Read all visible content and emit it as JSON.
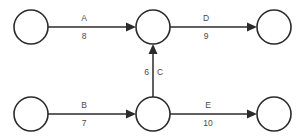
{
  "diagram": {
    "type": "directed-graph",
    "title": "",
    "background_color": "#ffffff",
    "stroke_color": "#2b2b2b",
    "label_color": "#4a4a4a",
    "nodes": [
      {
        "id": "n1",
        "label": "",
        "cx": 31,
        "cy": 27,
        "r": 17
      },
      {
        "id": "n2",
        "label": "",
        "cx": 153,
        "cy": 27,
        "r": 17
      },
      {
        "id": "n3",
        "label": "",
        "cx": 274,
        "cy": 27,
        "r": 17
      },
      {
        "id": "n4",
        "label": "",
        "cx": 31,
        "cy": 114,
        "r": 17
      },
      {
        "id": "n5",
        "label": "",
        "cx": 153,
        "cy": 114,
        "r": 17
      },
      {
        "id": "n6",
        "label": "",
        "cx": 274,
        "cy": 114,
        "r": 17
      }
    ],
    "edges": [
      {
        "id": "e_a",
        "name": "A",
        "weight": "8",
        "from": "n1",
        "to": "n2",
        "orientation": "horizontal",
        "label_x": 84,
        "name_y": 19,
        "weight_y": 37
      },
      {
        "id": "e_d",
        "name": "D",
        "weight": "9",
        "from": "n2",
        "to": "n3",
        "orientation": "horizontal",
        "label_x": 206,
        "name_y": 19,
        "weight_y": 37
      },
      {
        "id": "e_c",
        "name": "C",
        "weight": "6",
        "from": "n5",
        "to": "n2",
        "orientation": "vertical",
        "label_y": 73,
        "name_x": 157,
        "weight_x": 149
      },
      {
        "id": "e_b",
        "name": "B",
        "weight": "7",
        "from": "n4",
        "to": "n5",
        "orientation": "horizontal",
        "label_x": 84,
        "name_y": 106,
        "weight_y": 124
      },
      {
        "id": "e_e",
        "name": "E",
        "weight": "10",
        "from": "n5",
        "to": "n6",
        "orientation": "horizontal",
        "label_x": 208,
        "name_y": 106,
        "weight_y": 124
      }
    ]
  }
}
